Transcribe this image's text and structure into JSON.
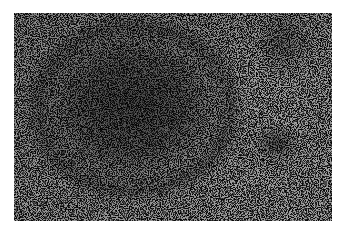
{
  "image": {
    "kind": "histology-micrograph",
    "description": "Grayscale light-microscopy image of tissue showing a dark, dense oval lymphoid nodule on the left-center surrounded by lighter, uniformly stippled cellular tissue",
    "colors": {
      "background": "#ffffff",
      "tissue_mid": "#8a8a8a",
      "nodule_dark": "#3a3a3a",
      "light_area": "#aaaaaa"
    },
    "bounds": {
      "x": 14,
      "y": 13,
      "width": 318,
      "height": 208
    }
  }
}
